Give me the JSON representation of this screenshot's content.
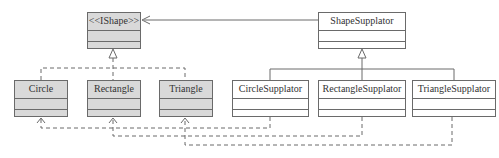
{
  "classes": {
    "ishape": {
      "name": "<<IShape>>",
      "x": 87,
      "y": 12,
      "w": 54,
      "h": 37,
      "fill": "gray"
    },
    "shape_supplator": {
      "name": "ShapeSupplator",
      "x": 318,
      "y": 12,
      "w": 88,
      "h": 37,
      "fill": "white"
    },
    "circle": {
      "name": "Circle",
      "x": 14,
      "y": 80,
      "w": 54,
      "h": 37,
      "fill": "gray"
    },
    "rectangle": {
      "name": "Rectangle",
      "x": 87,
      "y": 80,
      "w": 54,
      "h": 37,
      "fill": "gray"
    },
    "triangle": {
      "name": "Triangle",
      "x": 159,
      "y": 80,
      "w": 54,
      "h": 37,
      "fill": "gray"
    },
    "circle_supplator": {
      "name": "CircleSupplator",
      "x": 232,
      "y": 80,
      "w": 77,
      "h": 37,
      "fill": "white"
    },
    "rectangle_supplator": {
      "name": "RectangleSupplator",
      "x": 318,
      "y": 80,
      "w": 88,
      "h": 37,
      "fill": "white"
    },
    "triangle_supplator": {
      "name": "TriangleSupplator",
      "x": 412,
      "y": 80,
      "w": 84,
      "h": 37,
      "fill": "white"
    }
  },
  "relations": [
    {
      "type": "realization",
      "from": [
        "Circle",
        "Rectangle",
        "Triangle"
      ],
      "to": "<<IShape>>"
    },
    {
      "type": "generalization",
      "from": [
        "CircleSupplator",
        "RectangleSupplator",
        "TriangleSupplator"
      ],
      "to": "ShapeSupplator"
    },
    {
      "type": "association",
      "from": "ShapeSupplator",
      "to": "<<IShape>>"
    },
    {
      "type": "dependency",
      "from": "CircleSupplator",
      "to": "Circle"
    },
    {
      "type": "dependency",
      "from": "RectangleSupplator",
      "to": "Rectangle"
    },
    {
      "type": "dependency",
      "from": "TriangleSupplator",
      "to": "Triangle"
    }
  ],
  "colors": {
    "line": "#6a6a6a",
    "gray_fill": "#d9d9d9",
    "white_fill": "#ffffff"
  }
}
